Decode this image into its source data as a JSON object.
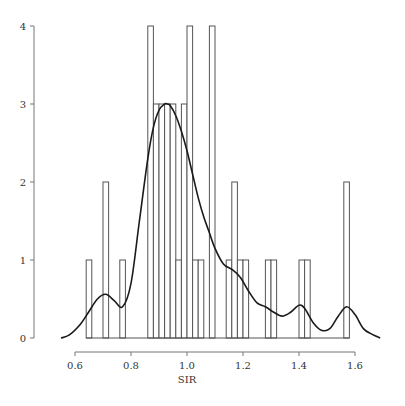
{
  "chart_data": {
    "type": "bar",
    "title": "",
    "xlabel": "SIR",
    "ylabel": "",
    "xlim": [
      0.55,
      1.7
    ],
    "ylim": [
      0,
      4
    ],
    "grid": false,
    "legend": null,
    "x_ticks": [
      0.6,
      0.8,
      1.0,
      1.2,
      1.4,
      1.6
    ],
    "x_tick_labels": [
      "0.6",
      "0.8",
      "1.0",
      "1.2",
      "1.4",
      "1.6"
    ],
    "y_ticks": [
      0,
      1,
      2,
      3,
      4
    ],
    "y_tick_labels": [
      "0",
      "1",
      "2",
      "3",
      "4"
    ],
    "bin_width": 0.02,
    "bins": [
      {
        "start": 0.64,
        "end": 0.66,
        "count": 1
      },
      {
        "start": 0.7,
        "end": 0.72,
        "count": 2
      },
      {
        "start": 0.76,
        "end": 0.78,
        "count": 1
      },
      {
        "start": 0.86,
        "end": 0.88,
        "count": 4
      },
      {
        "start": 0.88,
        "end": 0.9,
        "count": 3
      },
      {
        "start": 0.9,
        "end": 0.92,
        "count": 3
      },
      {
        "start": 0.92,
        "end": 0.94,
        "count": 3
      },
      {
        "start": 0.94,
        "end": 0.96,
        "count": 3
      },
      {
        "start": 0.96,
        "end": 0.98,
        "count": 1
      },
      {
        "start": 0.98,
        "end": 1.0,
        "count": 3
      },
      {
        "start": 1.0,
        "end": 1.02,
        "count": 4
      },
      {
        "start": 1.02,
        "end": 1.04,
        "count": 1
      },
      {
        "start": 1.04,
        "end": 1.06,
        "count": 1
      },
      {
        "start": 1.08,
        "end": 1.1,
        "count": 4
      },
      {
        "start": 1.14,
        "end": 1.16,
        "count": 1
      },
      {
        "start": 1.16,
        "end": 1.18,
        "count": 2
      },
      {
        "start": 1.18,
        "end": 1.2,
        "count": 1
      },
      {
        "start": 1.2,
        "end": 1.22,
        "count": 1
      },
      {
        "start": 1.28,
        "end": 1.3,
        "count": 1
      },
      {
        "start": 1.3,
        "end": 1.32,
        "count": 1
      },
      {
        "start": 1.4,
        "end": 1.42,
        "count": 1
      },
      {
        "start": 1.42,
        "end": 1.44,
        "count": 1
      },
      {
        "start": 1.56,
        "end": 1.58,
        "count": 2
      }
    ],
    "density_curve": {
      "name": "kernel density (scaled)",
      "x": [
        0.55,
        0.58,
        0.62,
        0.65,
        0.68,
        0.71,
        0.74,
        0.77,
        0.8,
        0.83,
        0.86,
        0.88,
        0.9,
        0.92,
        0.93,
        0.94,
        0.96,
        0.98,
        1.0,
        1.02,
        1.04,
        1.06,
        1.08,
        1.1,
        1.13,
        1.16,
        1.19,
        1.22,
        1.25,
        1.28,
        1.31,
        1.34,
        1.37,
        1.4,
        1.42,
        1.45,
        1.48,
        1.51,
        1.54,
        1.57,
        1.6,
        1.63,
        1.66,
        1.69
      ],
      "y": [
        0.0,
        0.04,
        0.18,
        0.34,
        0.5,
        0.56,
        0.48,
        0.4,
        0.7,
        1.5,
        2.3,
        2.7,
        2.92,
        3.0,
        3.0,
        2.98,
        2.85,
        2.65,
        2.4,
        2.1,
        1.8,
        1.55,
        1.35,
        1.15,
        0.95,
        0.88,
        0.78,
        0.6,
        0.45,
        0.4,
        0.33,
        0.28,
        0.33,
        0.42,
        0.38,
        0.2,
        0.1,
        0.12,
        0.28,
        0.4,
        0.3,
        0.12,
        0.05,
        0.0
      ]
    },
    "colors": {
      "bar_stroke": "#555555",
      "bar_fill": "#ffffff",
      "curve": "#1a1a1a",
      "axis": "#777777"
    }
  }
}
